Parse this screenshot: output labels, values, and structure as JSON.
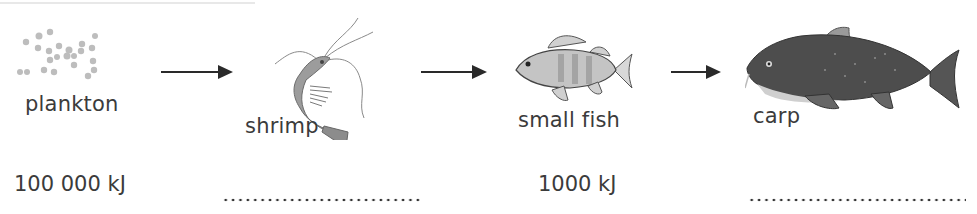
{
  "diagram": {
    "type": "food-chain",
    "organisms": [
      {
        "name": "plankton",
        "icon": "plankton-icon",
        "energy": "100 000 kJ"
      },
      {
        "name": "shrimp",
        "icon": "shrimp-icon",
        "energy": ""
      },
      {
        "name": "small fish",
        "icon": "small-fish-icon",
        "energy": "1000 kJ"
      },
      {
        "name": "carp",
        "icon": "carp-icon",
        "energy": ""
      }
    ],
    "arrows": [
      "plankton→shrimp",
      "shrimp→small fish",
      "small fish→carp"
    ],
    "blank_placeholder": "........................",
    "colors": {
      "text": "#3b3b3b",
      "arrow": "#2a2a2a",
      "plankton": "#b8b8b8",
      "carp": "#4a4a4a"
    }
  }
}
